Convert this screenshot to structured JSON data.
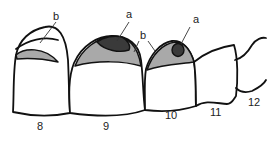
{
  "diagram": {
    "colors": {
      "lesion_a": "#3a3a3a",
      "lesion_b": "#a9a9a9",
      "outline": "#111111",
      "background": "#ffffff"
    },
    "labels": {
      "a_left": "a",
      "a_right": "a",
      "b_left": "b",
      "b_middle": "b"
    },
    "teeth": [
      {
        "number": "8"
      },
      {
        "number": "9"
      },
      {
        "number": "10"
      },
      {
        "number": "11"
      },
      {
        "number": "12"
      }
    ]
  }
}
